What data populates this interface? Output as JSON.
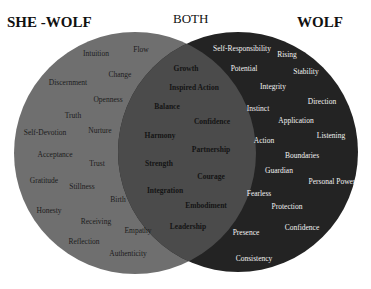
{
  "diagram": {
    "type": "venn",
    "colors": {
      "left_circle": "#6f6f6f",
      "overlap": "#4b4b4b",
      "right_circle": "#232323",
      "background": "#ffffff"
    },
    "headings": {
      "left": "SHE -WOLF",
      "both": "BOTH",
      "right": "WOLF"
    },
    "left_only": [
      {
        "label": "Intuition",
        "x": 96,
        "y": 53
      },
      {
        "label": "Flow",
        "x": 141,
        "y": 49
      },
      {
        "label": "Change",
        "x": 120,
        "y": 74
      },
      {
        "label": "Discernment",
        "x": 68,
        "y": 82
      },
      {
        "label": "Openness",
        "x": 108,
        "y": 99
      },
      {
        "label": "Truth",
        "x": 73,
        "y": 115
      },
      {
        "label": "Self-Devotion",
        "x": 45,
        "y": 132
      },
      {
        "label": "Nurture",
        "x": 100,
        "y": 130
      },
      {
        "label": "Acceptance",
        "x": 55,
        "y": 154
      },
      {
        "label": "Trust",
        "x": 97,
        "y": 163
      },
      {
        "label": "Gratitude",
        "x": 44,
        "y": 180
      },
      {
        "label": "Stillness",
        "x": 82,
        "y": 186
      },
      {
        "label": "Birth",
        "x": 118,
        "y": 199
      },
      {
        "label": "Honesty",
        "x": 49,
        "y": 210
      },
      {
        "label": "Receiving",
        "x": 96,
        "y": 221
      },
      {
        "label": "Empathy",
        "x": 138,
        "y": 230
      },
      {
        "label": "Reflection",
        "x": 84,
        "y": 241
      },
      {
        "label": "Authenticity",
        "x": 128,
        "y": 253
      }
    ],
    "both": [
      {
        "label": "Growth",
        "x": 186,
        "y": 68
      },
      {
        "label": "Inspired Action",
        "x": 194,
        "y": 87
      },
      {
        "label": "Balance",
        "x": 167,
        "y": 106
      },
      {
        "label": "Confidence",
        "x": 212,
        "y": 121
      },
      {
        "label": "Harmony",
        "x": 160,
        "y": 135
      },
      {
        "label": "Partnership",
        "x": 211,
        "y": 149
      },
      {
        "label": "Strength",
        "x": 159,
        "y": 163
      },
      {
        "label": "Courage",
        "x": 211,
        "y": 176
      },
      {
        "label": "Integration",
        "x": 165,
        "y": 190
      },
      {
        "label": "Embodiment",
        "x": 206,
        "y": 205
      },
      {
        "label": "Leadership",
        "x": 188,
        "y": 226
      }
    ],
    "right_only": [
      {
        "label": "Self-Responsibility",
        "x": 242,
        "y": 48
      },
      {
        "label": "Rising",
        "x": 287,
        "y": 54
      },
      {
        "label": "Potential",
        "x": 244,
        "y": 68
      },
      {
        "label": "Stability",
        "x": 306,
        "y": 71
      },
      {
        "label": "Integrity",
        "x": 273,
        "y": 86
      },
      {
        "label": "Direction",
        "x": 322,
        "y": 101
      },
      {
        "label": "Instinct",
        "x": 258,
        "y": 108
      },
      {
        "label": "Application",
        "x": 296,
        "y": 120
      },
      {
        "label": "Listening",
        "x": 331,
        "y": 135
      },
      {
        "label": "Action",
        "x": 264,
        "y": 140
      },
      {
        "label": "Boundaries",
        "x": 302,
        "y": 155
      },
      {
        "label": "Guardian",
        "x": 279,
        "y": 170
      },
      {
        "label": "Personal Power",
        "x": 332,
        "y": 181
      },
      {
        "label": "Fearless",
        "x": 259,
        "y": 193
      },
      {
        "label": "Protection",
        "x": 287,
        "y": 206
      },
      {
        "label": "Confidence",
        "x": 302,
        "y": 227
      },
      {
        "label": "Presence",
        "x": 246,
        "y": 232
      },
      {
        "label": "Consistency",
        "x": 254,
        "y": 258
      }
    ]
  }
}
